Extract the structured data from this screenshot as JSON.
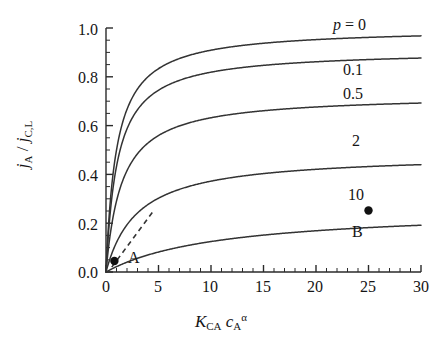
{
  "chart_data": {
    "type": "line",
    "title": "",
    "xlabel": "K_CA c_A^alpha",
    "ylabel": "j_A / j_C,L",
    "xlim": [
      0,
      30
    ],
    "ylim": [
      0.0,
      1.0
    ],
    "grid": false,
    "legend_position": "inline-right",
    "x_ticks": [
      "0",
      "5",
      "10",
      "15",
      "20",
      "25",
      "30"
    ],
    "x_tick_values": [
      0,
      5,
      10,
      15,
      20,
      25,
      30
    ],
    "x_minor_tick_step": 1,
    "y_ticks": [
      "0.0",
      "0.2",
      "0.4",
      "0.6",
      "0.8",
      "1.0"
    ],
    "y_tick_values": [
      0.0,
      0.2,
      0.4,
      0.6,
      0.8,
      1.0
    ],
    "y_minor_tick_step": 0.05,
    "series": [
      {
        "name": "p = 0",
        "p": 0,
        "label": "p = 0",
        "saturation": 1.0,
        "x": [
          0,
          0.5,
          1,
          2,
          3,
          4,
          5,
          7,
          10,
          15,
          20,
          25,
          30
        ],
        "values": [
          0.0,
          0.333,
          0.5,
          0.667,
          0.75,
          0.8,
          0.833,
          0.875,
          0.909,
          0.938,
          0.952,
          0.962,
          0.968
        ]
      },
      {
        "name": "0.1",
        "p": 0.1,
        "label": "0.1",
        "saturation": 0.909,
        "x": [
          0,
          0.5,
          1,
          2,
          3,
          4,
          5,
          7,
          10,
          15,
          20,
          25,
          30
        ],
        "values": [
          0.0,
          0.313,
          0.476,
          0.645,
          0.732,
          0.784,
          0.82,
          0.864,
          0.901,
          0.932,
          0.947,
          0.957,
          0.964
        ]
      },
      {
        "name": "0.5",
        "p": 0.5,
        "label": "0.5",
        "saturation": 0.727,
        "x": [
          0,
          0.5,
          1,
          2,
          3,
          4,
          5,
          7,
          10,
          15,
          20,
          25,
          30
        ],
        "values": [
          0.0,
          0.222,
          0.364,
          0.533,
          0.632,
          0.696,
          0.741,
          0.8,
          0.851,
          0.896,
          0.92,
          0.935,
          0.945
        ]
      },
      {
        "name": "2",
        "p": 2,
        "label": "2",
        "saturation": 0.484,
        "x": [
          0,
          0.5,
          1,
          2,
          3,
          4,
          5,
          7,
          10,
          15,
          20,
          25,
          30
        ],
        "values": [
          0.0,
          0.091,
          0.167,
          0.286,
          0.375,
          0.444,
          0.5,
          0.583,
          0.667,
          0.75,
          0.8,
          0.833,
          0.857
        ]
      },
      {
        "name": "10",
        "p": 10,
        "label": "10",
        "saturation": 0.262,
        "x": [
          0,
          0.5,
          1,
          2,
          3,
          4,
          5,
          7,
          10,
          15,
          20,
          25,
          30
        ],
        "values": [
          0.0,
          0.026,
          0.05,
          0.095,
          0.136,
          0.174,
          0.208,
          0.269,
          0.345,
          0.444,
          0.513,
          0.562,
          0.6
        ]
      }
    ],
    "markers": [
      {
        "label": "A",
        "x": 0.8,
        "y": 0.045,
        "label_position": "right"
      },
      {
        "label": "B",
        "x": 25.0,
        "y": 0.252,
        "label_position": "below",
        "upper_label": "10"
      }
    ],
    "annotations": [
      {
        "name": "tangent-dashed-line",
        "style": "dashed",
        "from": {
          "x": 0.55,
          "y": 0.02
        },
        "to": {
          "x": 4.6,
          "y": 0.255
        }
      }
    ]
  },
  "labels": {
    "y_axis_title_parts": {
      "j1": "j",
      "sub1": "A",
      "slash": "/",
      "j2": "j",
      "sub2": "C,L"
    },
    "x_axis_title_parts": {
      "K": "K",
      "Ksub": "CA",
      "c": "c",
      "csub": "A",
      "csup": "α"
    },
    "curve_p0_prefix": "p",
    "curve_p0_eq": "= 0"
  }
}
